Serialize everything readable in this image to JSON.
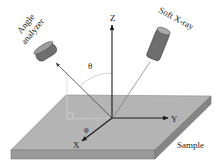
{
  "diagram": {
    "labels": {
      "analyzer": [
        "Angle",
        "analyzer"
      ],
      "xray_source": "Soft X-ray",
      "z_axis": "Z",
      "y_axis": "Y",
      "x_axis": "X",
      "polar_angle": "θ",
      "azimuth_angle": "φ",
      "sample": "Sample"
    },
    "colors": {
      "sample_top": "#b4b4b4",
      "sample_front": "#9a9a9a",
      "sample_side": "#858585",
      "device_body": "#6e6e6e",
      "device_cap": "#9c9c9c",
      "axis": "#1a1a1a",
      "beam": "#555555",
      "guide": "#d8d8d8"
    }
  }
}
